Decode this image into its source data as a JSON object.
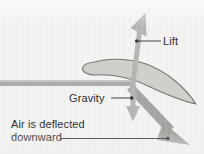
{
  "figure": {
    "background_color": "#f3f3f1"
  },
  "labels": {
    "lift": "Lift",
    "gravity": "Gravity",
    "air_line1": "Air is deflected",
    "air_line2": "downward"
  },
  "colors": {
    "airfoil_fill": "#cfcfca",
    "airfoil_stroke": "#6f6f6c",
    "arrow_light": "#b0b0ad",
    "arrow_dark": "#9a9a96",
    "flow_bar": "#a9a9a6",
    "leader_line": "#3a3a3a",
    "text": "#2a2a2a"
  },
  "elements": {
    "airfoil": {
      "name": "airfoil-wing",
      "leading_edge": [
        85,
        64
      ],
      "trailing_edge": [
        196,
        104
      ]
    },
    "lift_arrow": {
      "name": "lift-arrow",
      "from": [
        133,
        86
      ],
      "to": [
        145,
        14
      ],
      "direction": "up"
    },
    "gravity_arrow": {
      "name": "gravity-arrow",
      "from": [
        133,
        86
      ],
      "to": [
        133,
        121
      ],
      "direction": "down"
    },
    "deflected_air_arrow": {
      "name": "deflected-air-arrow",
      "from": [
        134,
        87
      ],
      "to": [
        187,
        142
      ],
      "direction": "down-right"
    },
    "airflow_bar": {
      "name": "incoming-airflow-bar",
      "from": [
        0,
        83
      ],
      "to": [
        133,
        83
      ]
    },
    "leader_lift": {
      "name": "lift-leader-line",
      "from": [
        161,
        41
      ],
      "dot": [
        137,
        41
      ]
    },
    "leader_gravity": {
      "name": "gravity-leader-line",
      "from": [
        112,
        98
      ],
      "dot": [
        132,
        98
      ]
    },
    "leader_air": {
      "name": "air-leader-line",
      "from": [
        60,
        138
      ],
      "dot": [
        168,
        138
      ]
    }
  }
}
